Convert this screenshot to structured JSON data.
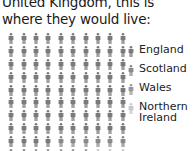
{
  "title": "United Kingdom, this is where they would live:",
  "chart_data": {
    "type": "pictogram",
    "grid": {
      "columns": 10,
      "rows": 10
    },
    "categories": [
      "England",
      "Scotland",
      "Wales",
      "Northern Ireland"
    ],
    "values": [
      84,
      8,
      5,
      3
    ],
    "colors": [
      "#7a7a7a",
      "#8a8a8a",
      "#9a9a9a",
      "#c8c8c8"
    ],
    "legend_position": "right"
  },
  "legend": [
    {
      "label": "England",
      "color": "#7a7a7a"
    },
    {
      "label": "Scotland",
      "color": "#8a8a8a"
    },
    {
      "label": "Wales",
      "color": "#9a9a9a"
    },
    {
      "label": "Northern\nIreland",
      "color": "#c8c8c8"
    }
  ]
}
